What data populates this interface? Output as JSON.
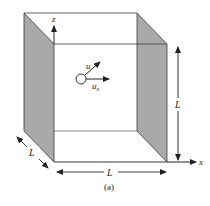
{
  "figure": {
    "caption": "(a)",
    "colors": {
      "line": "#3a3a3a",
      "shade": "#a9a9a9",
      "background": "#ffffff"
    },
    "axes": {
      "z_label": "z",
      "x_label": "x"
    },
    "particle": {
      "velocity_label": "u",
      "component_label": "u",
      "component_subscript": "x"
    },
    "dimensions": {
      "height_label": "L",
      "width_label": "L",
      "depth_label": "L"
    }
  }
}
